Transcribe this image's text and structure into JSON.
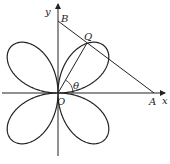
{
  "diagram": {
    "curve": {
      "type": "rose",
      "equation": "r = a sin 2θ",
      "petals": 4
    },
    "labels": {
      "x_axis": "x",
      "y_axis": "y",
      "origin": "O",
      "point_a": "A",
      "point_b": "B",
      "point_q": "Q",
      "angle": "θ"
    },
    "colors": {
      "stroke": "#222222",
      "background": "#ffffff"
    }
  }
}
